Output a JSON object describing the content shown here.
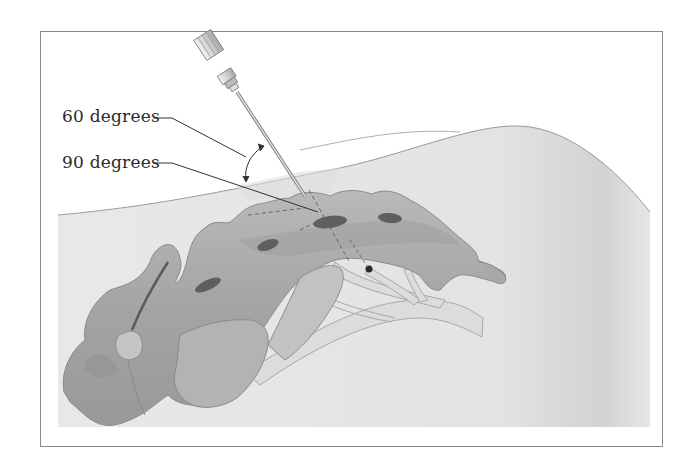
{
  "figure": {
    "labels": {
      "angle_60": "60 degrees",
      "angle_90": "90 degrees"
    },
    "colors": {
      "frame_border": "#8a8a8a",
      "tissue_fill": "#e6e6e6",
      "bone_fill": "#a9a9a9",
      "bone_shadow": "#8e8e8e",
      "foramen_fill": "#5f5f5f",
      "nerve_fill": "#dadada",
      "needle_hub": "#d0d0d0",
      "text": "#2a2a2a"
    },
    "elements": [
      "needle",
      "angle-arc-arrow",
      "skin-surface-curve",
      "sacrum",
      "sacral-foramina",
      "nerve-roots",
      "needle-tip-point",
      "dashed-guide-lines"
    ]
  }
}
